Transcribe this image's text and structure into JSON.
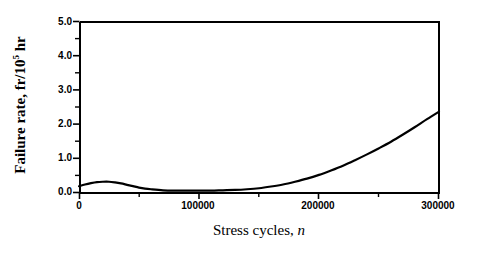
{
  "chart_data": {
    "type": "line",
    "title": "",
    "xlabel": "Stress cycles, n",
    "xlabel_plain": "Stress cycles,",
    "xlabel_italic": "n",
    "ylabel": "Failure rate, fr/10^5 hr",
    "ylabel_prefix": "Failure rate, fr/10",
    "ylabel_exponent": "5",
    "ylabel_suffix": " hr",
    "xlim": [
      0,
      300000
    ],
    "ylim": [
      0.0,
      5.0
    ],
    "grid": false,
    "legend": "none",
    "xticks": [
      0,
      100000,
      200000,
      300000
    ],
    "xtick_labels": [
      "0",
      "100000",
      "200000",
      "300000"
    ],
    "xminor_ticks": [
      50000,
      150000,
      250000
    ],
    "yticks": [
      0.0,
      1.0,
      2.0,
      3.0,
      4.0,
      5.0
    ],
    "ytick_labels": [
      "0.0",
      "1.0",
      "2.0",
      "3.0",
      "4.0",
      "5.0"
    ],
    "yminor_ticks": [
      0.5,
      1.5,
      2.5,
      3.5,
      4.5
    ],
    "series": [
      {
        "name": "Failure rate",
        "color": "#000000",
        "line_width": 2.2,
        "x": [
          0,
          5000,
          10000,
          15000,
          20000,
          25000,
          30000,
          35000,
          40000,
          45000,
          50000,
          55000,
          60000,
          70000,
          80000,
          90000,
          100000,
          110000,
          120000,
          130000,
          140000,
          150000,
          160000,
          170000,
          180000,
          190000,
          200000,
          210000,
          220000,
          230000,
          240000,
          250000,
          260000,
          270000,
          280000,
          290000,
          300000
        ],
        "y": [
          0.17,
          0.22,
          0.26,
          0.29,
          0.3,
          0.3,
          0.28,
          0.25,
          0.21,
          0.17,
          0.13,
          0.1,
          0.08,
          0.05,
          0.04,
          0.04,
          0.04,
          0.04,
          0.05,
          0.06,
          0.08,
          0.11,
          0.16,
          0.22,
          0.3,
          0.39,
          0.5,
          0.63,
          0.77,
          0.93,
          1.1,
          1.28,
          1.47,
          1.68,
          1.9,
          2.13,
          2.35
        ]
      }
    ]
  },
  "axes_geometry": {
    "left_px": 79,
    "right_px": 439,
    "top_px": 21,
    "bottom_px": 192
  }
}
